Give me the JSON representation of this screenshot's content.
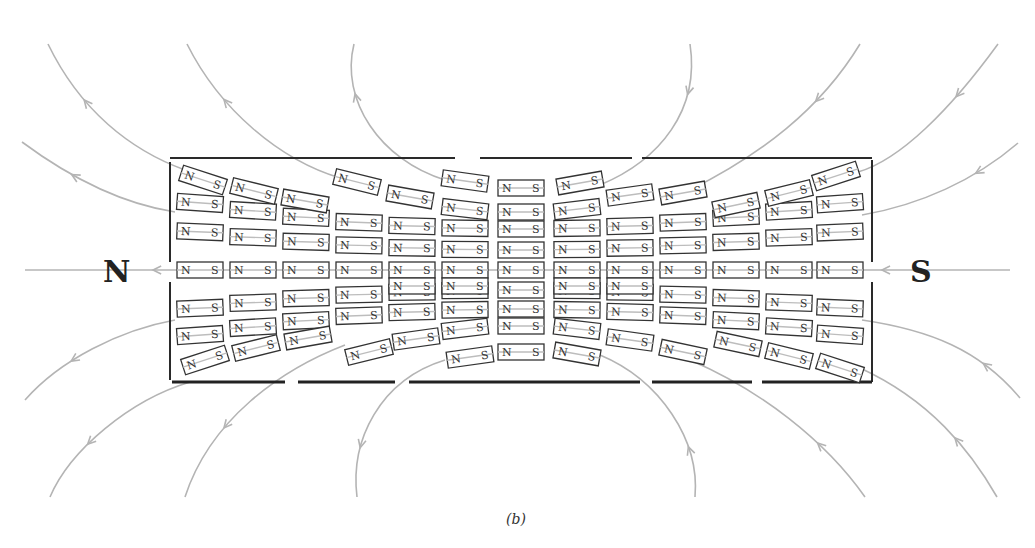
{
  "figure": {
    "caption": "(b)",
    "pole_left": "N",
    "pole_right": "S",
    "dipole_north_label": "N",
    "dipole_south_label": "S",
    "colors": {
      "field_line": "#b4b4b4",
      "outline": "#2a2a2a",
      "text": "#222222",
      "background": "#ffffff"
    },
    "dipole_rows": [
      {
        "name": "row-top-outer",
        "count": 4,
        "side": "left"
      },
      {
        "name": "row-top-outer-right",
        "count": 4,
        "side": "right"
      },
      {
        "name": "row-top",
        "count": 13
      },
      {
        "name": "row-upper",
        "count": 13
      },
      {
        "name": "row-axis",
        "count": 13
      },
      {
        "name": "row-lower",
        "count": 13
      },
      {
        "name": "row-bottom",
        "count": 13
      },
      {
        "name": "row-bottom-outer",
        "count": 9
      }
    ],
    "field_line_count": 14
  }
}
